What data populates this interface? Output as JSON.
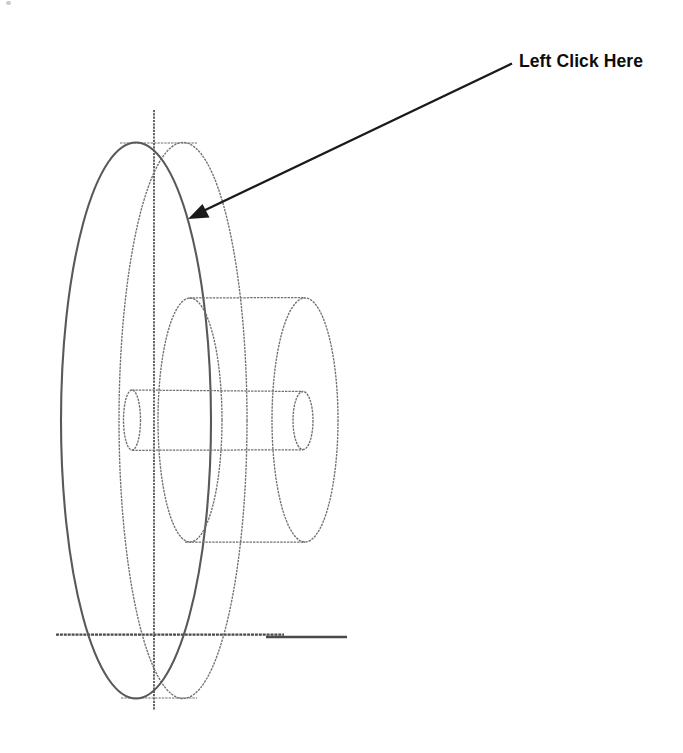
{
  "callout": {
    "label": "Left Click Here"
  },
  "colors": {
    "background": "#ffffff",
    "wireframe": "#707070",
    "wireframe_bold": "#595959",
    "axis": "#4a4a4a",
    "annotation": "#1a1a1a"
  }
}
